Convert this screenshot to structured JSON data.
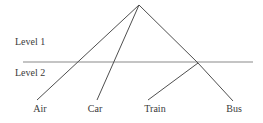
{
  "diagram": {
    "levels": [
      {
        "label": "Level 1"
      },
      {
        "label": "Level 2"
      }
    ],
    "leaves": [
      {
        "label": "Air"
      },
      {
        "label": "Car"
      },
      {
        "label": "Train"
      },
      {
        "label": "Bus"
      }
    ],
    "colors": {
      "branch_line": "#4f4f4f",
      "divider_line": "#8a8a8a",
      "text": "#3a3a3a",
      "background": "#ffffff"
    }
  }
}
